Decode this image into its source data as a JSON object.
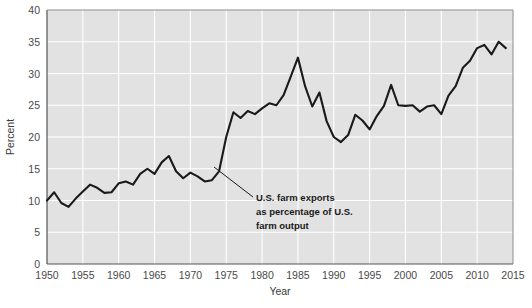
{
  "chart_data": {
    "type": "line",
    "title": "",
    "xlabel": "Year",
    "ylabel": "Percent",
    "xlim": [
      1950,
      2015
    ],
    "ylim": [
      0,
      40
    ],
    "xticks": [
      1950,
      1955,
      1960,
      1965,
      1970,
      1975,
      1980,
      1985,
      1990,
      1995,
      2000,
      2005,
      2010,
      2015
    ],
    "yticks": [
      0,
      5,
      10,
      15,
      20,
      25,
      30,
      35,
      40
    ],
    "grid": true,
    "legend": "none",
    "series_name": "U.S. farm exports as percentage of U.S. farm output",
    "line_color": "#1a1a1a",
    "plot_background": "#e2e2e2",
    "figure_background": "#ffffff",
    "grid_color": "#ffffff",
    "annotation": {
      "line1": "U.S. farm exports",
      "line2": "as percentage of U.S.",
      "line3": "farm output"
    },
    "x": [
      1950,
      1951,
      1952,
      1953,
      1954,
      1955,
      1956,
      1957,
      1958,
      1959,
      1960,
      1961,
      1962,
      1963,
      1964,
      1965,
      1966,
      1967,
      1968,
      1969,
      1970,
      1971,
      1972,
      1973,
      1974,
      1975,
      1976,
      1977,
      1978,
      1979,
      1980,
      1981,
      1982,
      1983,
      1984,
      1985,
      1986,
      1987,
      1988,
      1989,
      1990,
      1991,
      1992,
      1993,
      1994,
      1995,
      1996,
      1997,
      1998,
      1999,
      2000,
      2001,
      2002,
      2003,
      2004,
      2005,
      2006,
      2007,
      2008,
      2009,
      2010,
      2011,
      2012,
      2013,
      2014
    ],
    "values": [
      10.0,
      11.3,
      9.6,
      9.0,
      10.3,
      11.4,
      12.5,
      12.0,
      11.2,
      11.3,
      12.7,
      13.0,
      12.5,
      14.2,
      15.0,
      14.2,
      16.0,
      17.0,
      14.6,
      13.5,
      14.4,
      13.8,
      13.0,
      13.2,
      14.6,
      20.0,
      23.9,
      23.0,
      24.1,
      23.6,
      24.5,
      25.3,
      25.0,
      26.6,
      29.5,
      32.5,
      28.0,
      24.8,
      27.0,
      22.5,
      20.0,
      19.2,
      20.3,
      23.5,
      22.6,
      21.2,
      23.3,
      24.9,
      28.2,
      25.0,
      24.9,
      25.0,
      24.0,
      24.8,
      25.0,
      23.6,
      26.5,
      28.0,
      30.9,
      32.0,
      34.0,
      34.5,
      33.0,
      35.0,
      34.0
    ]
  },
  "chart_meta": {
    "x_tick_labels": [
      "1950",
      "1955",
      "1960",
      "1965",
      "1970",
      "1975",
      "1980",
      "1985",
      "1990",
      "1995",
      "2000",
      "2005",
      "2010",
      "2015"
    ],
    "y_tick_labels": [
      "0",
      "5",
      "10",
      "15",
      "20",
      "25",
      "30",
      "35",
      "40"
    ]
  }
}
